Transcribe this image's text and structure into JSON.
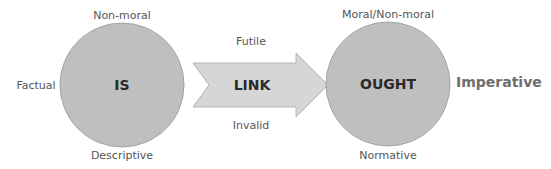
{
  "diagram": {
    "type": "is-ought-gap",
    "colors": {
      "circle_fill": "#bfbfbf",
      "circle_stroke": "#a3a3a3",
      "arrow_fill": "#d6d6d6",
      "arrow_stroke": "#b4b4b4",
      "label": "#555555",
      "node_text": "#2a2a2a",
      "imperative": "#6e6e6e"
    },
    "is_node": {
      "label": "IS",
      "top": "Non-moral",
      "left": "Factual",
      "bottom": "Descriptive"
    },
    "link": {
      "label": "LINK",
      "top": "Futile",
      "bottom": "Invalid"
    },
    "ought_node": {
      "label": "OUGHT",
      "top": "Moral/Non-moral",
      "right": "Imperative",
      "bottom": "Normative"
    }
  }
}
